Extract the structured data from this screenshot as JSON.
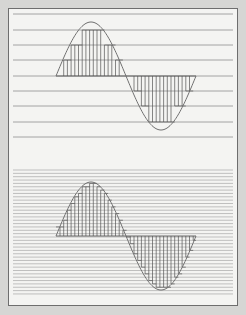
{
  "diagram": {
    "title": "",
    "colors": {
      "background": "#d6d6d4",
      "panel": "#f4f4f2",
      "border": "#6e6e6e",
      "grid_line": "#9a9a9a",
      "wave": "#707070",
      "sample_line": "#555555"
    },
    "wave": {
      "x_start": 56,
      "x_end": 196,
      "sample_spacing": 3.7,
      "sample_x_start": 60
    },
    "panels": [
      {
        "name": "low-resolution",
        "baseline_y": 76,
        "amplitude": 54,
        "levels_y": [
          14,
          30,
          45,
          60,
          76,
          91,
          106,
          122,
          137
        ],
        "line_x_start": 13,
        "line_x_end": 233
      },
      {
        "name": "high-resolution",
        "baseline_y": 236,
        "amplitude": 54,
        "level_first_y": 170,
        "level_last_y": 297,
        "level_spacing": 3.35,
        "line_x_start": 13,
        "line_x_end": 233
      }
    ]
  }
}
